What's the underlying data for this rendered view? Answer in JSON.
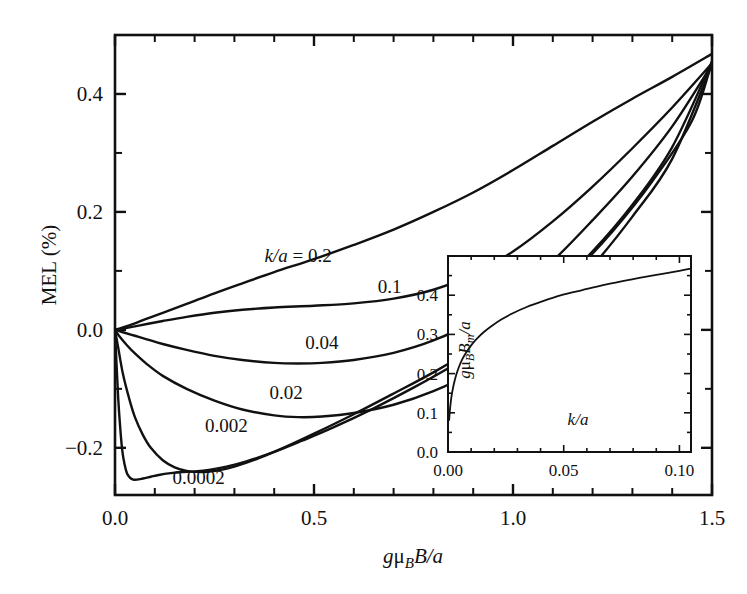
{
  "figure": {
    "background": "#ffffff",
    "line_color": "#111111",
    "axis_color": "#111111"
  },
  "chart_data": {
    "type": "line",
    "title": "",
    "xlabel": "gμBB/a",
    "xlabel_parts": {
      "g": "g",
      "mu": "μ",
      "B_sub": "B",
      "B": "B",
      "slash_a": "/a"
    },
    "ylabel": "MEL (%)",
    "xlim": [
      0.0,
      1.5
    ],
    "ylim": [
      -0.28,
      0.5
    ],
    "grid": false,
    "legend": "inline-curve-labels",
    "xticks": [
      0.0,
      0.5,
      1.0,
      1.5
    ],
    "xtick_labels": [
      "0.0",
      "0.5",
      "1.0",
      "1.5"
    ],
    "xminor_step": 0.1,
    "yticks": [
      -0.2,
      0.0,
      0.2,
      0.4
    ],
    "ytick_labels": [
      "-0.2",
      "0.0",
      "0.2",
      "0.4"
    ],
    "yminor_step": 0.1,
    "series": [
      {
        "name": "k/a = 0.2",
        "label": "k/a = 0.2",
        "label_x": 0.46,
        "label_y": 0.115,
        "points": [
          [
            0.0,
            0.0
          ],
          [
            0.02,
            0.004
          ],
          [
            0.05,
            0.011
          ],
          [
            0.08,
            0.019
          ],
          [
            0.12,
            0.029
          ],
          [
            0.18,
            0.044
          ],
          [
            0.25,
            0.062
          ],
          [
            0.32,
            0.079
          ],
          [
            0.4,
            0.098
          ],
          [
            0.5,
            0.12
          ],
          [
            0.6,
            0.144
          ],
          [
            0.7,
            0.17
          ],
          [
            0.8,
            0.2
          ],
          [
            0.9,
            0.233
          ],
          [
            1.0,
            0.271
          ],
          [
            1.1,
            0.312
          ],
          [
            1.2,
            0.353
          ],
          [
            1.3,
            0.392
          ],
          [
            1.4,
            0.429
          ],
          [
            1.5,
            0.468
          ]
        ]
      },
      {
        "name": "k/a = 0.1",
        "label": "0.1",
        "label_x": 0.69,
        "label_y": 0.063,
        "points": [
          [
            0.0,
            0.0
          ],
          [
            0.02,
            0.002
          ],
          [
            0.05,
            0.006
          ],
          [
            0.08,
            0.01
          ],
          [
            0.12,
            0.015
          ],
          [
            0.18,
            0.022
          ],
          [
            0.25,
            0.029
          ],
          [
            0.32,
            0.034
          ],
          [
            0.4,
            0.038
          ],
          [
            0.5,
            0.041
          ],
          [
            0.6,
            0.045
          ],
          [
            0.7,
            0.053
          ],
          [
            0.8,
            0.068
          ],
          [
            0.9,
            0.094
          ],
          [
            1.0,
            0.133
          ],
          [
            1.1,
            0.184
          ],
          [
            1.2,
            0.243
          ],
          [
            1.3,
            0.308
          ],
          [
            1.4,
            0.377
          ],
          [
            1.5,
            0.452
          ]
        ]
      },
      {
        "name": "k/a = 0.04",
        "label": "0.04",
        "label_x": 0.52,
        "label_y": -0.033,
        "points": [
          [
            0.0,
            0.0
          ],
          [
            0.02,
            -0.004
          ],
          [
            0.05,
            -0.01
          ],
          [
            0.08,
            -0.016
          ],
          [
            0.12,
            -0.024
          ],
          [
            0.18,
            -0.034
          ],
          [
            0.25,
            -0.044
          ],
          [
            0.32,
            -0.051
          ],
          [
            0.4,
            -0.056
          ],
          [
            0.46,
            -0.057
          ],
          [
            0.52,
            -0.056
          ],
          [
            0.6,
            -0.051
          ],
          [
            0.7,
            -0.039
          ],
          [
            0.8,
            -0.018
          ],
          [
            0.9,
            0.014
          ],
          [
            1.0,
            0.06
          ],
          [
            1.1,
            0.117
          ],
          [
            1.2,
            0.186
          ],
          [
            1.3,
            0.26
          ],
          [
            1.4,
            0.345
          ],
          [
            1.5,
            0.45
          ]
        ]
      },
      {
        "name": "k/a = 0.02",
        "label": "0.02",
        "label_x": 0.43,
        "label_y": -0.117,
        "points": [
          [
            0.0,
            0.0
          ],
          [
            0.01,
            -0.01
          ],
          [
            0.03,
            -0.026
          ],
          [
            0.05,
            -0.04
          ],
          [
            0.08,
            -0.058
          ],
          [
            0.12,
            -0.078
          ],
          [
            0.18,
            -0.1
          ],
          [
            0.25,
            -0.12
          ],
          [
            0.32,
            -0.135
          ],
          [
            0.4,
            -0.145
          ],
          [
            0.46,
            -0.148
          ],
          [
            0.52,
            -0.147
          ],
          [
            0.6,
            -0.141
          ],
          [
            0.7,
            -0.127
          ],
          [
            0.8,
            -0.104
          ],
          [
            0.9,
            -0.071
          ],
          [
            1.0,
            -0.025
          ],
          [
            1.1,
            0.035
          ],
          [
            1.2,
            0.108
          ],
          [
            1.3,
            0.192
          ],
          [
            1.4,
            0.29
          ],
          [
            1.5,
            0.45
          ]
        ]
      },
      {
        "name": "k/a = 0.002",
        "label": "0.002",
        "label_x": 0.28,
        "label_y": -0.174,
        "points": [
          [
            0.0,
            0.0
          ],
          [
            0.008,
            -0.03
          ],
          [
            0.02,
            -0.075
          ],
          [
            0.035,
            -0.115
          ],
          [
            0.05,
            -0.148
          ],
          [
            0.07,
            -0.178
          ],
          [
            0.09,
            -0.2
          ],
          [
            0.12,
            -0.221
          ],
          [
            0.15,
            -0.233
          ],
          [
            0.18,
            -0.239
          ],
          [
            0.22,
            -0.241
          ],
          [
            0.26,
            -0.238
          ],
          [
            0.3,
            -0.232
          ],
          [
            0.36,
            -0.218
          ],
          [
            0.43,
            -0.198
          ],
          [
            0.5,
            -0.176
          ],
          [
            0.6,
            -0.143
          ],
          [
            0.7,
            -0.108
          ],
          [
            0.8,
            -0.072
          ],
          [
            0.9,
            -0.032
          ],
          [
            1.0,
            0.014
          ],
          [
            1.1,
            0.068
          ],
          [
            1.2,
            0.133
          ],
          [
            1.3,
            0.212
          ],
          [
            1.4,
            0.31
          ],
          [
            1.5,
            0.455
          ]
        ]
      },
      {
        "name": "k/a = 0.0002",
        "label": "0.0002",
        "label_x": 0.21,
        "label_y": -0.261,
        "points": [
          [
            0.0,
            0.0
          ],
          [
            0.004,
            -0.06
          ],
          [
            0.008,
            -0.115
          ],
          [
            0.013,
            -0.165
          ],
          [
            0.018,
            -0.203
          ],
          [
            0.024,
            -0.228
          ],
          [
            0.03,
            -0.243
          ],
          [
            0.038,
            -0.251
          ],
          [
            0.046,
            -0.254
          ],
          [
            0.055,
            -0.254
          ],
          [
            0.07,
            -0.252
          ],
          [
            0.09,
            -0.249
          ],
          [
            0.11,
            -0.246
          ],
          [
            0.14,
            -0.243
          ],
          [
            0.17,
            -0.241
          ],
          [
            0.2,
            -0.24
          ],
          [
            0.24,
            -0.237
          ],
          [
            0.28,
            -0.232
          ],
          [
            0.33,
            -0.223
          ],
          [
            0.4,
            -0.207
          ],
          [
            0.47,
            -0.188
          ],
          [
            0.55,
            -0.165
          ],
          [
            0.65,
            -0.133
          ],
          [
            0.75,
            -0.098
          ],
          [
            0.85,
            -0.06
          ],
          [
            0.95,
            -0.017
          ],
          [
            1.05,
            0.035
          ],
          [
            1.15,
            0.095
          ],
          [
            1.25,
            0.167
          ],
          [
            1.35,
            0.252
          ],
          [
            1.45,
            0.355
          ],
          [
            1.5,
            0.455
          ]
        ]
      }
    ]
  },
  "inset": {
    "type": "line",
    "xlabel": "k/a",
    "ylabel": "gμBBm/a",
    "xlim": [
      0.0,
      0.105
    ],
    "ylim": [
      0.0,
      0.5
    ],
    "xticks": [
      0.0,
      0.05,
      0.1
    ],
    "xtick_labels": [
      "0.00",
      "0.05",
      "0.10"
    ],
    "yticks": [
      0.0,
      0.1,
      0.2,
      0.3,
      0.4
    ],
    "ytick_labels": [
      "0.0",
      "0.1",
      "0.2",
      "0.3",
      "0.4"
    ],
    "points": [
      [
        0.0005,
        0.082
      ],
      [
        0.0008,
        0.105
      ],
      [
        0.0012,
        0.128
      ],
      [
        0.0018,
        0.152
      ],
      [
        0.0025,
        0.173
      ],
      [
        0.0035,
        0.196
      ],
      [
        0.0048,
        0.218
      ],
      [
        0.0062,
        0.237
      ],
      [
        0.008,
        0.255
      ],
      [
        0.01,
        0.272
      ],
      [
        0.0125,
        0.289
      ],
      [
        0.0155,
        0.306
      ],
      [
        0.019,
        0.322
      ],
      [
        0.023,
        0.338
      ],
      [
        0.028,
        0.354
      ],
      [
        0.034,
        0.37
      ],
      [
        0.041,
        0.385
      ],
      [
        0.049,
        0.4
      ],
      [
        0.058,
        0.413
      ],
      [
        0.068,
        0.427
      ],
      [
        0.079,
        0.44
      ],
      [
        0.09,
        0.452
      ],
      [
        0.1,
        0.462
      ],
      [
        0.105,
        0.468
      ]
    ]
  }
}
